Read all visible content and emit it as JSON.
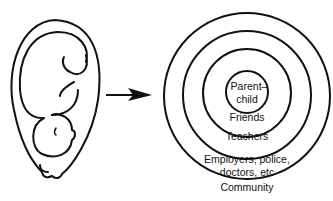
{
  "diagram": {
    "left_figure": "fetus-in-womb",
    "arrow": "right-arrow",
    "circles": [
      {
        "label": "Parent–",
        "label2": "child"
      },
      {
        "label": "Friends"
      },
      {
        "label": "Teachers"
      },
      {
        "label": "Employers, police,",
        "label2": "doctors, etc"
      },
      {
        "label": "Community"
      }
    ]
  }
}
